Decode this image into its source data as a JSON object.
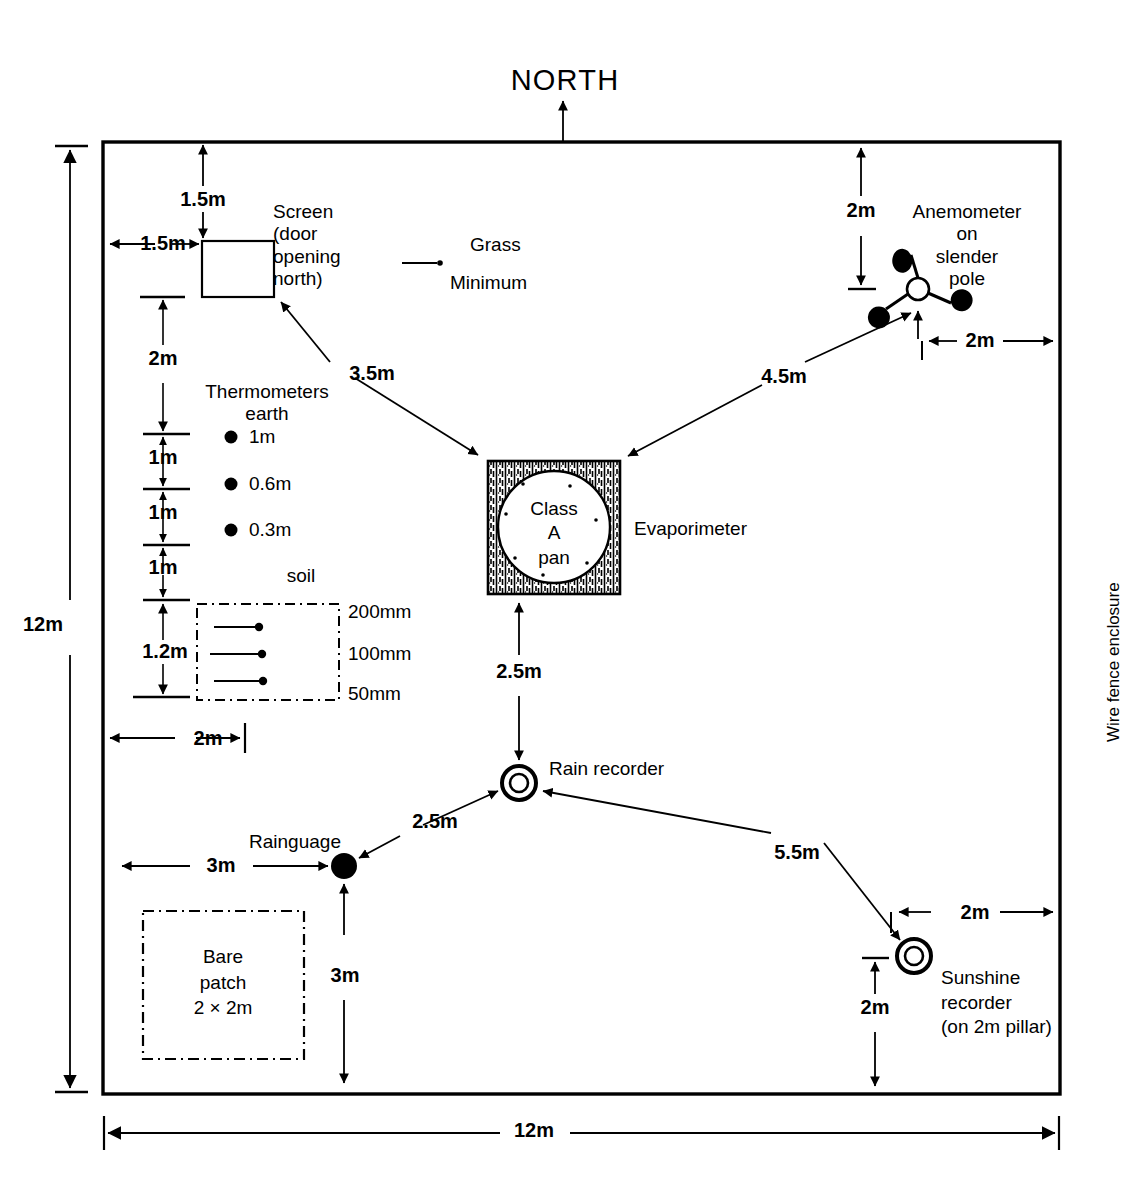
{
  "diagram": {
    "compass": {
      "label": "NORTH"
    },
    "enclosure": {
      "label": "Wire fence enclosure"
    },
    "overall_dimensions": {
      "width": "12m",
      "height": "12m"
    },
    "instruments": [
      {
        "id": "screen",
        "label": "Screen\n(door\nopening\nnorth)"
      },
      {
        "id": "anemometer",
        "label": "Anemometer\non\nslender\npole"
      },
      {
        "id": "evaporimeter",
        "label": "Evaporimeter"
      },
      {
        "id": "class-a-pan",
        "label": "Class\nA\npan"
      },
      {
        "id": "rain-recorder",
        "label": "Rain recorder"
      },
      {
        "id": "rainguage",
        "label": "Rainguage"
      },
      {
        "id": "sunshine-recorder",
        "label": "Sunshine\nrecorder\n(on 2m pillar)"
      },
      {
        "id": "bare-patch",
        "label": "Bare\npatch\n2 × 2m"
      }
    ],
    "grass_minimum": {
      "top_label": "Grass",
      "bottom_label": "Minimum"
    },
    "thermometers": {
      "heading": "Thermometers\nearth",
      "depths": [
        "1m",
        "0.6m",
        "0.3m"
      ]
    },
    "soil": {
      "heading": "soil",
      "depths": [
        "200mm",
        "100mm",
        "50mm"
      ]
    },
    "dimensions": [
      {
        "id": "screen-from-north-fence",
        "value": "1.5m"
      },
      {
        "id": "screen-from-west-fence",
        "value": "1.5m"
      },
      {
        "id": "screen-to-thermo-1m",
        "value": "2m"
      },
      {
        "id": "thermo-1m-to-0p6m",
        "value": "1m"
      },
      {
        "id": "thermo-0p6m-to-0p3m",
        "value": "1m"
      },
      {
        "id": "thermo-0p3m-to-soil",
        "value": "1m"
      },
      {
        "id": "soil-box-height",
        "value": "1.2m"
      },
      {
        "id": "thermo-row-from-fence",
        "value": "2m"
      },
      {
        "id": "screen-to-pan",
        "value": "3.5m"
      },
      {
        "id": "anemometer-from-north",
        "value": "2m"
      },
      {
        "id": "anemometer-from-east",
        "value": "2m"
      },
      {
        "id": "pan-to-anemometer",
        "value": "4.5m"
      },
      {
        "id": "pan-to-rain-recorder",
        "value": "2.5m"
      },
      {
        "id": "rainguage-to-recorder",
        "value": "2.5m"
      },
      {
        "id": "rainguage-from-west",
        "value": "3m"
      },
      {
        "id": "rainguage-from-south",
        "value": "3m"
      },
      {
        "id": "recorder-to-sunshine",
        "value": "5.5m"
      },
      {
        "id": "sunshine-from-east",
        "value": "2m"
      },
      {
        "id": "sunshine-from-south",
        "value": "2m"
      },
      {
        "id": "enclosure-height",
        "value": "12m"
      },
      {
        "id": "enclosure-width",
        "value": "12m"
      }
    ]
  }
}
